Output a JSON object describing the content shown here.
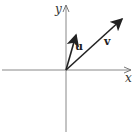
{
  "diagram": {
    "axes": {
      "x_label": "x",
      "y_label": "y"
    },
    "vectors": [
      {
        "name": "u",
        "label": "u"
      },
      {
        "name": "v",
        "label": "v"
      }
    ],
    "colors": {
      "axis": "#777777",
      "vector": "#222222"
    }
  }
}
